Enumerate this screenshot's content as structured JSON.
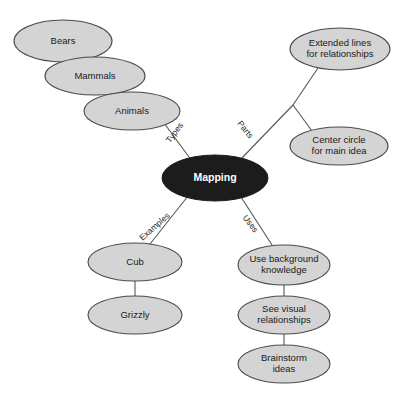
{
  "diagram": {
    "title": "Mapping",
    "type": "mind-map",
    "background_color": "#ffffff",
    "node_fill_color": "#d4d4d4",
    "node_stroke_color": "#4a4a4c",
    "center_fill_color": "#1c1c1c",
    "center_text_color": "#ffffff",
    "connector_color": "#55565a"
  },
  "center": {
    "label": "Mapping",
    "cx": 215,
    "cy": 178,
    "rx": 53,
    "ry": 23
  },
  "branches": [
    {
      "id": "types",
      "label": "Types",
      "label_x": 175,
      "label_y": 133,
      "label_rotation": -53
    },
    {
      "id": "parts",
      "label": "Parts",
      "label_x": 245,
      "label_y": 130,
      "label_rotation": 52
    },
    {
      "id": "examples",
      "label": "Examples",
      "label_x": 155,
      "label_y": 227,
      "label_rotation": -41
    },
    {
      "id": "uses",
      "label": "Uses",
      "label_x": 250,
      "label_y": 224,
      "label_rotation": 52
    }
  ],
  "nodes": [
    {
      "id": "bears",
      "branch": "types",
      "lines": [
        "Bears"
      ],
      "cx": 63,
      "cy": 41,
      "rx": 49,
      "ry": 21
    },
    {
      "id": "mammals",
      "branch": "types",
      "lines": [
        "Mammals"
      ],
      "cx": 95,
      "cy": 76,
      "rx": 50,
      "ry": 19
    },
    {
      "id": "animals",
      "branch": "types",
      "lines": [
        "Animals"
      ],
      "cx": 132,
      "cy": 111,
      "rx": 48,
      "ry": 19
    },
    {
      "id": "extended-lines",
      "branch": "parts",
      "lines": [
        "Extended lines",
        "for relationships"
      ],
      "cx": 340,
      "cy": 49,
      "rx": 50,
      "ry": 21
    },
    {
      "id": "center-circle",
      "branch": "parts",
      "lines": [
        "Center circle",
        "for main idea"
      ],
      "cx": 339,
      "cy": 146,
      "rx": 49,
      "ry": 19
    },
    {
      "id": "cub",
      "branch": "examples",
      "lines": [
        "Cub"
      ],
      "cx": 135,
      "cy": 262,
      "rx": 47,
      "ry": 19
    },
    {
      "id": "grizzly",
      "branch": "examples",
      "lines": [
        "Grizzly"
      ],
      "cx": 135,
      "cy": 315,
      "rx": 47,
      "ry": 19
    },
    {
      "id": "use-background-knowledge",
      "branch": "uses",
      "lines": [
        "Use background",
        "knowledge"
      ],
      "cx": 284,
      "cy": 265,
      "rx": 46,
      "ry": 20
    },
    {
      "id": "see-visual-relationships",
      "branch": "uses",
      "lines": [
        "See visual",
        "relationships"
      ],
      "cx": 284,
      "cy": 315,
      "rx": 46,
      "ry": 19
    },
    {
      "id": "brainstorm-ideas",
      "branch": "uses",
      "lines": [
        "Brainstorm",
        "ideas"
      ],
      "cx": 284,
      "cy": 364,
      "rx": 46,
      "ry": 19
    }
  ],
  "connectors": [
    {
      "id": "bears-mammals",
      "x1": 72,
      "y1": 61,
      "x2": 86,
      "y2": 58
    },
    {
      "id": "mammals-animals",
      "x1": 108,
      "y1": 94,
      "x2": 120,
      "y2": 93
    },
    {
      "id": "animals-center",
      "x1": 164,
      "y1": 123,
      "x2": 192,
      "y2": 161
    },
    {
      "id": "center-parts-junction",
      "x1": 240,
      "y1": 160,
      "x2": 293,
      "y2": 105
    },
    {
      "id": "junction-extended",
      "x1": 293,
      "y1": 105,
      "x2": 318,
      "y2": 68
    },
    {
      "id": "junction-center-circle",
      "x1": 293,
      "y1": 105,
      "x2": 312,
      "y2": 131
    },
    {
      "id": "center-examples",
      "x1": 188,
      "y1": 196,
      "x2": 150,
      "y2": 244
    },
    {
      "id": "cub-grizzly",
      "x1": 135,
      "y1": 281,
      "x2": 135,
      "y2": 296
    },
    {
      "id": "center-uses",
      "x1": 241,
      "y1": 197,
      "x2": 272,
      "y2": 245
    },
    {
      "id": "use-background-see-visual",
      "x1": 284,
      "y1": 285,
      "x2": 284,
      "y2": 296
    },
    {
      "id": "see-visual-brainstorm",
      "x1": 284,
      "y1": 334,
      "x2": 284,
      "y2": 345
    }
  ]
}
